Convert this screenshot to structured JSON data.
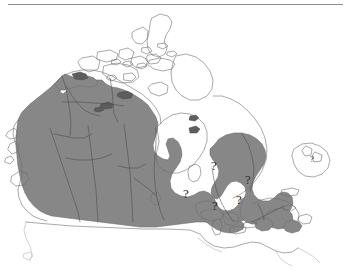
{
  "figure": {
    "kind": "distribution-range-map",
    "region": "Canada",
    "title": "",
    "caption": ""
  },
  "style": {
    "background_color": "#ffffff",
    "range_fill_color": "#878787",
    "coastline_color": "#6e6e6e",
    "internal_border_color": "#4a4a4a",
    "rule_color": "#8d8d8d",
    "annotation_color": "#2b2b2b"
  },
  "legend": {
    "shaded_meaning": "range",
    "question_mark_meaning": "status uncertain"
  },
  "annotations": [
    {
      "label": "?",
      "name": "question-mark-southern-manitoba",
      "x": 186,
      "y": 190
    },
    {
      "label": "?",
      "name": "question-mark-northwestern-ontario",
      "x": 215,
      "y": 202
    },
    {
      "label": "?",
      "name": "question-mark-southern-ontario",
      "x": 239,
      "y": 196
    },
    {
      "label": "?",
      "name": "question-mark-james-bay",
      "x": 214,
      "y": 162
    },
    {
      "label": "?",
      "name": "question-mark-central-quebec",
      "x": 248,
      "y": 176
    },
    {
      "label": "?",
      "name": "question-mark-newfoundland",
      "x": 312,
      "y": 154
    }
  ]
}
